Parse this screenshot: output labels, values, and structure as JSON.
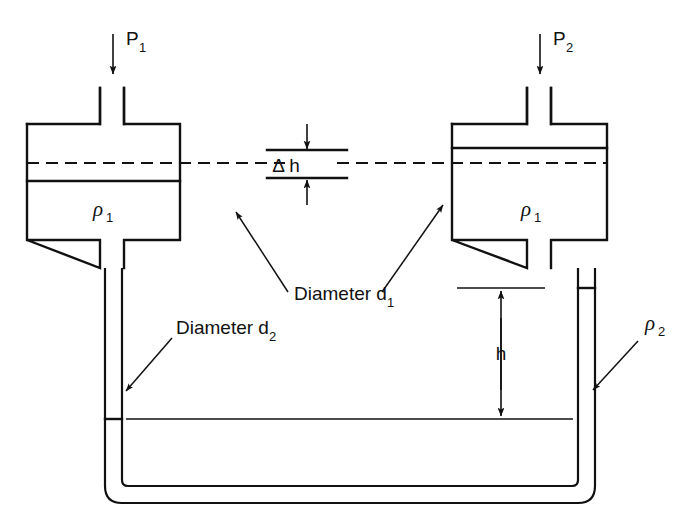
{
  "figure": {
    "background_color": "#ffffff",
    "line_color": "#111111"
  },
  "labels": {
    "pressure_left": "P",
    "pressure_left_sub": "1",
    "pressure_right": "P",
    "pressure_right_sub": "2",
    "density_upper_left": "ρ",
    "density_upper_left_sub": "1",
    "density_upper_right": "ρ",
    "density_upper_right_sub": "1",
    "density_lower": "ρ",
    "density_lower_sub": "2",
    "delta_h": "Δ h",
    "height_h": "h",
    "diameter_1": "Diameter d",
    "diameter_1_sub": "1",
    "diameter_2": "Diameter d",
    "diameter_2_sub": "2"
  },
  "icons": {
    "pressure_arrow_left": "arrow-down-icon",
    "pressure_arrow_right": "arrow-down-icon",
    "delta_h_arrow_top": "arrow-down-icon",
    "delta_h_arrow_bottom": "arrow-up-icon",
    "h_arrow_top": "arrow-up-icon",
    "h_arrow_bottom": "arrow-down-icon",
    "leader_diameter_1_left": "leader-arrow-icon",
    "leader_diameter_1_right": "leader-arrow-icon",
    "leader_diameter_2": "leader-arrow-icon",
    "leader_density_2": "leader-arrow-icon"
  },
  "geometry": {
    "left_chamber": {
      "x": 27,
      "y": 124,
      "width": 153,
      "height": 116
    },
    "right_chamber": {
      "x": 452,
      "y": 124,
      "width": 155,
      "height": 116
    },
    "left_stub_top": {
      "x1": 100,
      "x2": 124,
      "y_top": 88,
      "y_bottom": 124
    },
    "right_stub_top": {
      "x1": 527,
      "x2": 551,
      "y_top": 88,
      "y_bottom": 124
    },
    "centerline_y": 163,
    "left_level_y": 181,
    "right_level_y": 148,
    "utube_left_x": 105,
    "utube_right_x": 578,
    "utube_bottom_y": 500,
    "utube_width": 17,
    "rho2_level_y": 419,
    "h_top_y": 288,
    "h_bottom_y": 419
  }
}
